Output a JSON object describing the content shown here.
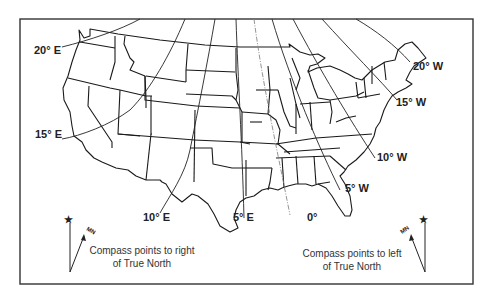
{
  "map": {
    "title": "Magnetic declination (isogonic lines) over the contiguous United States",
    "isogonic_labels": {
      "e20": "20° E",
      "e15": "15° E",
      "e10": "10° E",
      "e5": "5° E",
      "zero": "0°",
      "w5": "5° W",
      "w10": "10° W",
      "w15": "15° W",
      "w20": "20° W"
    },
    "legend": {
      "east": {
        "true_north_symbol": "★",
        "magnetic_label": "MN",
        "text_line1": "Compass points to right",
        "text_line2": "of True North"
      },
      "west": {
        "true_north_symbol": "★",
        "magnetic_label": "MN",
        "text_line1": "Compass points to left",
        "text_line2": "of True North"
      }
    },
    "colors": {
      "lines": "#1a1a1a",
      "agonic_line": "#888888",
      "background": "#ffffff"
    }
  }
}
